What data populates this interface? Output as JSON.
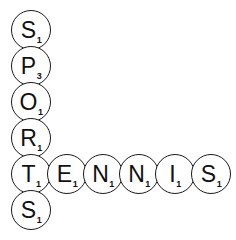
{
  "puzzle": {
    "kind": "letter-tile-crossword",
    "background_color": "#ffffff",
    "tile_outline_color": "#1a1a1a",
    "tile_text_color": "#111111",
    "tile_diameter_px": 40,
    "words": [
      {
        "name": "sports",
        "text": "SPORTS",
        "orientation": "vertical"
      },
      {
        "name": "tennis",
        "text": "TENNIS",
        "orientation": "horizontal"
      }
    ],
    "intersection_letter": "T",
    "tiles": [
      {
        "id": "v0",
        "letter": "S",
        "value": "1",
        "word": "sports",
        "x": 11,
        "y": 10
      },
      {
        "id": "v1",
        "letter": "P",
        "value": "3",
        "word": "sports",
        "x": 11,
        "y": 46
      },
      {
        "id": "v2",
        "letter": "O",
        "value": "1",
        "word": "sports",
        "x": 11,
        "y": 82
      },
      {
        "id": "v3",
        "letter": "R",
        "value": "1",
        "word": "sports",
        "x": 11,
        "y": 118
      },
      {
        "id": "v4",
        "letter": "T",
        "value": "1",
        "word": "sports-tennis",
        "x": 11,
        "y": 154
      },
      {
        "id": "v5",
        "letter": "S",
        "value": "1",
        "word": "sports",
        "x": 11,
        "y": 190
      },
      {
        "id": "h1",
        "letter": "E",
        "value": "1",
        "word": "tennis",
        "x": 47,
        "y": 154
      },
      {
        "id": "h2",
        "letter": "N",
        "value": "1",
        "word": "tennis",
        "x": 83,
        "y": 154
      },
      {
        "id": "h3",
        "letter": "N",
        "value": "1",
        "word": "tennis",
        "x": 119,
        "y": 154
      },
      {
        "id": "h4",
        "letter": "I",
        "value": "1",
        "word": "tennis",
        "x": 155,
        "y": 154
      },
      {
        "id": "h5",
        "letter": "S",
        "value": "1",
        "word": "tennis",
        "x": 191,
        "y": 154
      }
    ]
  }
}
